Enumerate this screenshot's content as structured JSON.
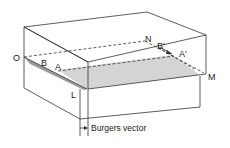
{
  "diagram": {
    "labels": {
      "O": "O",
      "B": "B",
      "A": "A",
      "N": "N",
      "B_prime": "B'",
      "A_prime": "A'",
      "M": "M",
      "L": "L"
    },
    "caption": "Burgers vector",
    "colors": {
      "slip_plane": "#d4d4d4",
      "ledge": "#9a9a9a",
      "edge": "#333333"
    }
  }
}
